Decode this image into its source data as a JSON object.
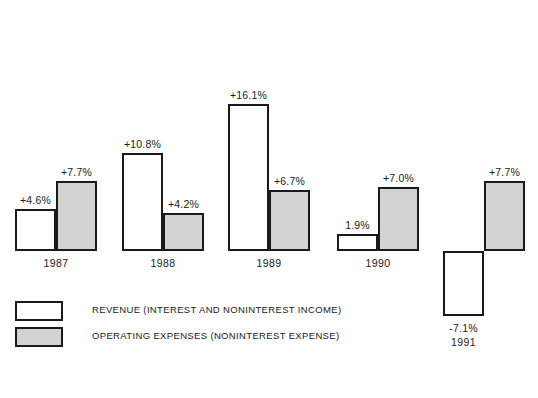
{
  "chart_data": {
    "type": "bar",
    "title": "",
    "subtitle": "",
    "xlabel": "",
    "ylabel": "",
    "grid": false,
    "legend_position": "bottom-left",
    "categories": [
      "1987",
      "1988",
      "1989",
      "1990",
      "1991"
    ],
    "series": [
      {
        "name": "REVENUE (INTEREST AND NONINTEREST INCOME)",
        "fill": "#ffffff",
        "values": [
          4.6,
          10.8,
          16.1,
          1.9,
          -7.1
        ],
        "labels": [
          "+4.6%",
          "+10.8%",
          "+16.1%",
          "1.9%",
          "-7.1%"
        ]
      },
      {
        "name": "OPERATING EXPENSES (NONINTEREST EXPENSE)",
        "fill": "#d3d3d3",
        "values": [
          7.7,
          4.2,
          6.7,
          7.0,
          7.7
        ],
        "labels": [
          "+7.7%",
          "+4.2%",
          "+6.7%",
          "+7.0%",
          "+7.7%"
        ]
      }
    ],
    "ylim": [
      -8,
      17
    ],
    "unit": "%"
  },
  "legend": {
    "items": [
      {
        "label": "REVENUE (INTEREST AND NONINTEREST INCOME)",
        "swatch": "revenue"
      },
      {
        "label": "OPERATING EXPENSES (NONINTEREST EXPENSE)",
        "swatch": "expense"
      }
    ]
  },
  "colors": {
    "revenue_fill": "#ffffff",
    "expense_fill": "#d3d3d3",
    "outline": "#1a1a1a",
    "background": "#ffffff"
  },
  "layout": {
    "baseline_y": 251,
    "px_per_percent": 9.1,
    "bar_width": 41,
    "group_x": [
      15,
      122,
      228,
      337,
      443
    ],
    "category_label_y": 257,
    "negative_label_offset": 6
  }
}
